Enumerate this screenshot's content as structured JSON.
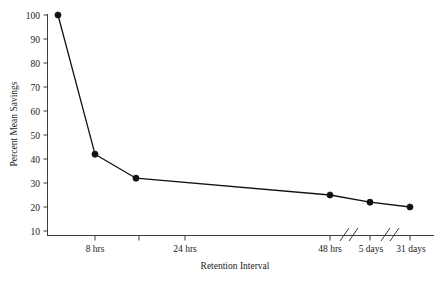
{
  "chart_data": {
    "type": "line",
    "title": "",
    "xlabel": "Retention Interval",
    "ylabel": "Percent Mean Savings",
    "ylim": [
      5,
      103
    ],
    "yticks": [
      10,
      20,
      30,
      40,
      50,
      60,
      70,
      80,
      90,
      100
    ],
    "ytick_labels": [
      "10",
      "20",
      "30",
      "40",
      "50",
      "60",
      "70",
      "80",
      "90",
      "100"
    ],
    "xtick_labels": [
      "8 hrs",
      "24 hrs",
      "48 hrs",
      "5 days",
      "31 days"
    ],
    "grid": false,
    "legend": null,
    "axis_breaks": 2,
    "series": [
      {
        "name": "Percent Mean Savings",
        "categories": [
          "20 min",
          "8 hrs",
          "1 day",
          "2 days",
          "6 days",
          "31 days"
        ],
        "x": [
          58,
          95,
          136,
          330,
          370,
          410
        ],
        "values": [
          100,
          42,
          32,
          25,
          22,
          20
        ]
      }
    ],
    "points": [
      {
        "label": "20 min",
        "x": 58,
        "value": 100
      },
      {
        "label": "8 hrs",
        "x": 95,
        "value": 42
      },
      {
        "label": "1 day",
        "x": 136,
        "value": 32
      },
      {
        "label": "2 days",
        "x": 330,
        "value": 25
      },
      {
        "label": "6 days",
        "x": 370,
        "value": 22
      },
      {
        "label": "31 days",
        "x": 410,
        "value": 20
      }
    ]
  },
  "axes": {
    "y_title": "Percent Mean Savings",
    "x_title": "Retention Interval",
    "y_ticks": [
      {
        "label": "100",
        "value": 100
      },
      {
        "label": "90",
        "value": 90
      },
      {
        "label": "80",
        "value": 80
      },
      {
        "label": "70",
        "value": 70
      },
      {
        "label": "60",
        "value": 60
      },
      {
        "label": "50",
        "value": 50
      },
      {
        "label": "40",
        "value": 40
      },
      {
        "label": "30",
        "value": 30
      },
      {
        "label": "20",
        "value": 20
      },
      {
        "label": "10",
        "value": 10
      }
    ],
    "x_ticks": [
      {
        "label": "8 hrs",
        "x": 95
      },
      {
        "label": "",
        "x": 139
      },
      {
        "label": "24 hrs",
        "x": 185
      },
      {
        "label": "48 hrs",
        "x": 330
      },
      {
        "label": "5 days",
        "x": 370
      },
      {
        "label": "31 days",
        "x": 410
      }
    ]
  },
  "caption": {
    "text": ""
  }
}
